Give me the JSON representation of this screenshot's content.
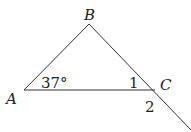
{
  "diagram": {
    "type": "triangle",
    "vertices": [
      {
        "name": "A",
        "x": 24,
        "y": 90
      },
      {
        "name": "B",
        "x": 89,
        "y": 24
      },
      {
        "name": "C",
        "x": 155,
        "y": 90
      }
    ],
    "extension_end": {
      "x": 191,
      "y": 130
    },
    "labels": {
      "A": "A",
      "B": "B",
      "C": "C",
      "angle_A": "37°",
      "angle_1": "1",
      "angle_2": "2"
    },
    "line_color": "#333333"
  }
}
